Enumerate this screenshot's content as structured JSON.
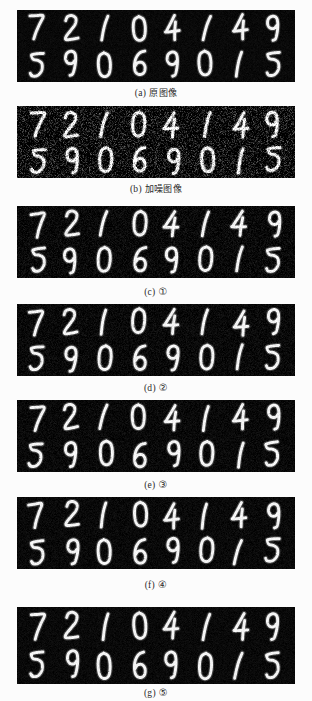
{
  "figure": {
    "background_color": "#fcfcfc",
    "panel_background_color": "#0a0a0a",
    "digit_color": "#f2f2f2",
    "digit_rows": [
      [
        "7",
        "2",
        "1",
        "0",
        "4",
        "1",
        "4",
        "9"
      ],
      [
        "5",
        "9",
        "0",
        "6",
        "9",
        "0",
        "1",
        "5"
      ]
    ],
    "panels": [
      {
        "tag": "(a)",
        "label": "原图像",
        "noise_level": 0.04,
        "blur": 0.0,
        "top": 10,
        "height": 72,
        "caption_top": 86
      },
      {
        "tag": "(b)",
        "label": "加噪图像",
        "noise_level": 0.42,
        "blur": 0.0,
        "top": 106,
        "height": 72,
        "caption_top": 182
      },
      {
        "tag": "(c)",
        "label": "①",
        "noise_level": 0.1,
        "blur": 0.3,
        "top": 206,
        "height": 72,
        "caption_top": 286
      },
      {
        "tag": "(d)",
        "label": "②",
        "noise_level": 0.08,
        "blur": 0.4,
        "top": 304,
        "height": 72,
        "caption_top": 382
      },
      {
        "tag": "(e)",
        "label": "③",
        "noise_level": 0.07,
        "blur": 0.5,
        "top": 400,
        "height": 72,
        "caption_top": 479
      },
      {
        "tag": "(f)",
        "label": "④",
        "noise_level": 0.06,
        "blur": 0.5,
        "top": 497,
        "height": 72,
        "caption_top": 579
      },
      {
        "tag": "(g)",
        "label": "⑤",
        "noise_level": 0.05,
        "blur": 0.4,
        "top": 607,
        "height": 77,
        "caption_top": 687
      }
    ]
  }
}
